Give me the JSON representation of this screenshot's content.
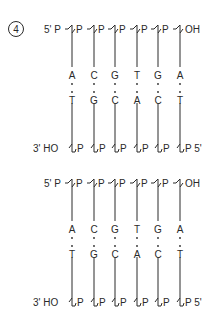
{
  "figure": {
    "label": "4",
    "colors": {
      "ink": "#2a2a2a",
      "background": "#ffffff"
    }
  },
  "panels": [
    {
      "top_strand": {
        "left_end": "5' P",
        "phosphate": "P",
        "right_end": "OH"
      },
      "bottom_strand": {
        "left_end": "3' HO",
        "phosphate": "P",
        "right_end": "P 5'"
      },
      "top_bases": [
        "A",
        "C",
        "G",
        "T",
        "G",
        "A"
      ],
      "bottom_bases": [
        "T",
        "G",
        "C",
        "A",
        "C",
        "T"
      ]
    },
    {
      "top_strand": {
        "left_end": "5' P",
        "phosphate": "P",
        "right_end": "OH"
      },
      "bottom_strand": {
        "left_end": "3' HO",
        "phosphate": "P",
        "right_end": "P 5'"
      },
      "top_bases": [
        "A",
        "C",
        "G",
        "T",
        "G",
        "A"
      ],
      "bottom_bases": [
        "T",
        "G",
        "C",
        "A",
        "C",
        "T"
      ]
    }
  ]
}
